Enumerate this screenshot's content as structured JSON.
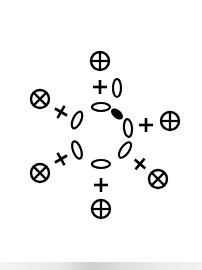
{
  "diagram": {
    "stroke_color": "#000000",
    "background": "#ffffff",
    "ring_lobes": [
      {
        "id": "top",
        "cx": 101,
        "cy": 107,
        "rx": 9,
        "ry": 4,
        "rotate": 0,
        "filled": false
      },
      {
        "id": "top-right",
        "cx": 117,
        "cy": 114,
        "rx": 6,
        "ry": 3,
        "rotate": 40,
        "filled": true
      },
      {
        "id": "right",
        "cx": 128,
        "cy": 128,
        "rx": 4,
        "ry": 9,
        "rotate": -5,
        "filled": false
      },
      {
        "id": "bottom-right",
        "cx": 125,
        "cy": 150,
        "rx": 4,
        "ry": 9,
        "rotate": 35,
        "filled": false
      },
      {
        "id": "bottom",
        "cx": 101,
        "cy": 164,
        "rx": 9,
        "ry": 4,
        "rotate": 0,
        "filled": false
      },
      {
        "id": "bottom-left",
        "cx": 77,
        "cy": 150,
        "rx": 4,
        "ry": 9,
        "rotate": -20,
        "filled": false
      },
      {
        "id": "left",
        "cx": 77,
        "cy": 120,
        "rx": 4,
        "ry": 9,
        "rotate": 25,
        "filled": false
      }
    ],
    "top_zero_lobe": {
      "cx": 117,
      "cy": 88,
      "rx": 4,
      "ry": 9
    },
    "plus_signs": [
      {
        "id": "top",
        "x": 100,
        "y": 87,
        "rotate": 0
      },
      {
        "id": "right",
        "x": 146,
        "y": 125,
        "rotate": 0
      },
      {
        "id": "upper-left",
        "x": 61,
        "y": 112,
        "rotate": 30
      },
      {
        "id": "lower-left",
        "x": 61,
        "y": 159,
        "rotate": -30
      },
      {
        "id": "lower-right",
        "x": 140,
        "y": 164,
        "rotate": 40
      },
      {
        "id": "bottom",
        "x": 101,
        "y": 185,
        "rotate": 0
      }
    ],
    "circled_plus": [
      {
        "id": "top",
        "cx": 100,
        "cy": 61,
        "r": 9,
        "rotate": 0
      },
      {
        "id": "right",
        "cx": 170,
        "cy": 121,
        "r": 9,
        "rotate": 0
      },
      {
        "id": "upper-left",
        "cx": 40,
        "cy": 99,
        "r": 9,
        "rotate": 45
      },
      {
        "id": "lower-left",
        "cx": 40,
        "cy": 173,
        "r": 9,
        "rotate": 45
      },
      {
        "id": "lower-right",
        "cx": 158,
        "cy": 179,
        "r": 9,
        "rotate": 45
      },
      {
        "id": "bottom",
        "cx": 101,
        "cy": 209,
        "r": 9,
        "rotate": 0
      }
    ]
  }
}
